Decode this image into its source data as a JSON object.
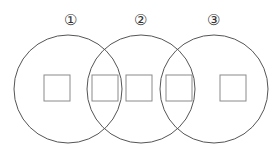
{
  "labels": [
    "①",
    "②",
    "③"
  ],
  "circles": [
    {
      "cx": 68,
      "cy": 89,
      "r": 54
    },
    {
      "cx": 141,
      "cy": 89,
      "r": 54
    },
    {
      "cx": 214,
      "cy": 89,
      "r": 54
    }
  ],
  "squares": [
    {
      "x": 44,
      "y": 75,
      "size": 26
    },
    {
      "x": 92,
      "y": 75,
      "size": 26
    },
    {
      "x": 126,
      "y": 75,
      "size": 26
    },
    {
      "x": 166,
      "y": 75,
      "size": 26
    },
    {
      "x": 220,
      "y": 75,
      "size": 26
    }
  ],
  "colors": {
    "circle": "#555555",
    "square": "#8a8a8a"
  }
}
